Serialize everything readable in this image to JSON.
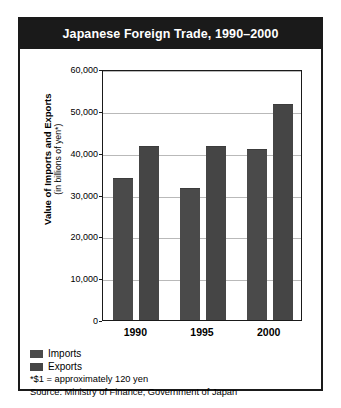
{
  "figure": {
    "title": "Japanese Foreign Trade, 1990–2000",
    "footnotes": [
      "*$1 = approximately 120 yen",
      "Source: Ministry of Finance, Government of Japan"
    ]
  },
  "axis": {
    "ylabel_line1": "Value of Imports and Exports",
    "ylabel_line2": "(in billions of yen*)"
  },
  "colors": {
    "title_bar": "#1a1a1a",
    "frame": "#1a1a1a",
    "imports_bar": "#4a4a4a",
    "exports_bar": "#454545",
    "gridline": "#b9b9b9",
    "background": "#ffffff"
  },
  "chart_data": {
    "type": "bar",
    "title": "Japanese Foreign Trade, 1990–2000",
    "xlabel": "",
    "ylabel": "Value of Imports and Exports (in billions of yen*)",
    "categories": [
      "1990",
      "1995",
      "2000"
    ],
    "series": [
      {
        "name": "Imports",
        "values": [
          33900,
          31500,
          40800
        ],
        "color": "#4a4a4a"
      },
      {
        "name": "Exports",
        "values": [
          41500,
          41500,
          51700
        ],
        "color": "#454545"
      }
    ],
    "ylim": [
      0,
      60000
    ],
    "ytick_values": [
      0,
      10000,
      20000,
      30000,
      40000,
      50000,
      60000
    ],
    "ytick_labels": [
      "0",
      "10,000",
      "20,000",
      "30,000",
      "40,000",
      "50,000",
      "60,000"
    ],
    "grid": true,
    "legend_position": "bottom-left",
    "annotations": [
      "*$1 = approximately 120 yen",
      "Source: Ministry of Finance, Government of Japan"
    ]
  }
}
